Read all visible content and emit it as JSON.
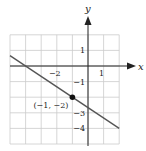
{
  "chart_data": {
    "type": "line",
    "title": "",
    "xlabel": "x",
    "ylabel": "y",
    "xlim": [
      -5,
      2
    ],
    "ylim": [
      -5,
      2
    ],
    "grid": true,
    "x_tick_labels": [
      {
        "value": -2,
        "text": "−2"
      },
      {
        "value": 1,
        "text": "1"
      }
    ],
    "y_tick_labels": [
      {
        "value": 1,
        "text": "1"
      },
      {
        "value": -1,
        "text": "−1"
      },
      {
        "value": -3,
        "text": "−3"
      },
      {
        "value": -4,
        "text": "−4"
      }
    ],
    "series": [
      {
        "name": "line",
        "equation": "y = -(2/3)x - 8/3",
        "slope": -0.6667,
        "y_intercept": -2.6667,
        "x": [
          -5,
          2
        ],
        "y": [
          0.6667,
          -4
        ]
      }
    ],
    "points": [
      {
        "x": -1,
        "y": -2,
        "label": "(−1, −2)"
      }
    ],
    "colors": {
      "line": "#555555",
      "grid": "#cccccc",
      "axis": "#222222",
      "point": "#111111"
    }
  }
}
